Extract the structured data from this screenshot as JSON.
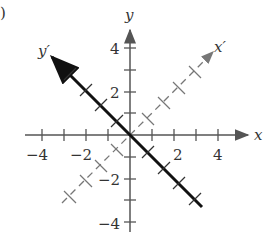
{
  "panel_label": ")",
  "axes": {
    "x_label": "x",
    "y_label": "y",
    "x_prime_label": "x′",
    "y_prime_label": "y′",
    "x_ticks": [
      "-4",
      "-2",
      "2",
      "4"
    ],
    "y_ticks": [
      "4",
      "2",
      "-2",
      "-4"
    ]
  },
  "colors": {
    "axis": "#555555",
    "line": "#111111",
    "dashed": "#777777"
  }
}
